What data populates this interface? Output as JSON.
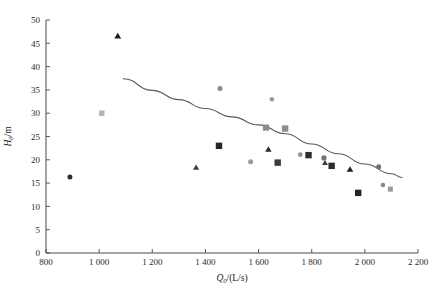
{
  "chart_data": {
    "type": "scatter",
    "title": "",
    "xlabel": "Q0/(L/s)",
    "ylabel": "H0/m",
    "xlabel_base": "Q",
    "xlabel_sub": "0",
    "xlabel_unit": "/(L/s)",
    "ylabel_base": "H",
    "ylabel_sub": "0",
    "ylabel_unit": "/m",
    "xlim": [
      800,
      2200
    ],
    "ylim": [
      0,
      50
    ],
    "xticks": [
      800,
      1000,
      1200,
      1400,
      1600,
      1800,
      2000,
      2200
    ],
    "xtick_labels": [
      "800",
      "1 000",
      "1 200",
      "1 400",
      "1 600",
      "1 800",
      "2 000",
      "2 200"
    ],
    "yticks": [
      0,
      5,
      10,
      15,
      20,
      25,
      30,
      35,
      40,
      45,
      50
    ],
    "ytick_labels": [
      "0",
      "5",
      "10",
      "15",
      "20",
      "25",
      "30",
      "35",
      "40",
      "45",
      "50"
    ],
    "grid": false,
    "legend": false,
    "legend_position": "none",
    "series": [
      {
        "name": "circle-markers",
        "marker": "circle",
        "color": "#3c3c3c",
        "points": [
          {
            "x": 890,
            "y": 16.3,
            "shade": "#2a2a2a",
            "size": 5.0
          },
          {
            "x": 1455,
            "y": 35.3,
            "shade": "#8a8a8a",
            "size": 5.0
          },
          {
            "x": 1570,
            "y": 19.6,
            "shade": "#9a9a9a",
            "size": 5.0
          },
          {
            "x": 1650,
            "y": 33.0,
            "shade": "#9a9a9a",
            "size": 4.6
          },
          {
            "x": 1757,
            "y": 21.1,
            "shade": "#8f8f8f",
            "size": 4.6
          },
          {
            "x": 1846,
            "y": 20.4,
            "shade": "#757575",
            "size": 5.2
          },
          {
            "x": 2052,
            "y": 18.5,
            "shade": "#6f6f6f",
            "size": 5.0
          },
          {
            "x": 2068,
            "y": 14.6,
            "shade": "#8a8a8a",
            "size": 4.6
          }
        ]
      },
      {
        "name": "square-markers",
        "marker": "square",
        "color": "#3a3a3a",
        "points": [
          {
            "x": 1010,
            "y": 30.0,
            "shade": "#b3b3b3",
            "size": 5.4
          },
          {
            "x": 1451,
            "y": 23.0,
            "shade": "#262626",
            "size": 6.4
          },
          {
            "x": 1628,
            "y": 26.9,
            "shade": "#8d8d8d",
            "size": 6.2
          },
          {
            "x": 1700,
            "y": 26.7,
            "shade": "#8d8d8d",
            "size": 6.4
          },
          {
            "x": 1672,
            "y": 19.4,
            "shade": "#3a3a3a",
            "size": 6.4
          },
          {
            "x": 1788,
            "y": 21.0,
            "shade": "#2d2d2d",
            "size": 6.4
          },
          {
            "x": 1875,
            "y": 18.7,
            "shade": "#2d2d2d",
            "size": 6.4
          },
          {
            "x": 1975,
            "y": 12.9,
            "shade": "#242424",
            "size": 6.4
          },
          {
            "x": 2096,
            "y": 13.7,
            "shade": "#9a9a9a",
            "size": 5.0
          }
        ]
      },
      {
        "name": "triangle-markers",
        "marker": "triangle",
        "color": "#222222",
        "points": [
          {
            "x": 1070,
            "y": 46.5,
            "shade": "#1c1c1c",
            "size": 6.0
          },
          {
            "x": 1365,
            "y": 18.3,
            "shade": "#3d3d3d",
            "size": 5.4
          },
          {
            "x": 1637,
            "y": 22.2,
            "shade": "#2a2a2a",
            "size": 5.6
          },
          {
            "x": 1850,
            "y": 19.3,
            "shade": "#3a3a3a",
            "size": 5.2
          },
          {
            "x": 1944,
            "y": 17.9,
            "shade": "#1f1f1f",
            "size": 5.8
          }
        ]
      }
    ],
    "trendline": {
      "name": "fitted-curve",
      "color": "#5a5a5a",
      "points": [
        {
          "x": 1090,
          "y": 37.4
        },
        {
          "x": 1200,
          "y": 34.9
        },
        {
          "x": 1300,
          "y": 32.9
        },
        {
          "x": 1400,
          "y": 31.0
        },
        {
          "x": 1500,
          "y": 29.2
        },
        {
          "x": 1600,
          "y": 27.5
        },
        {
          "x": 1700,
          "y": 25.6
        },
        {
          "x": 1800,
          "y": 23.4
        },
        {
          "x": 1900,
          "y": 21.3
        },
        {
          "x": 2000,
          "y": 19.1
        },
        {
          "x": 2100,
          "y": 17.0
        },
        {
          "x": 2140,
          "y": 16.2
        }
      ]
    }
  }
}
